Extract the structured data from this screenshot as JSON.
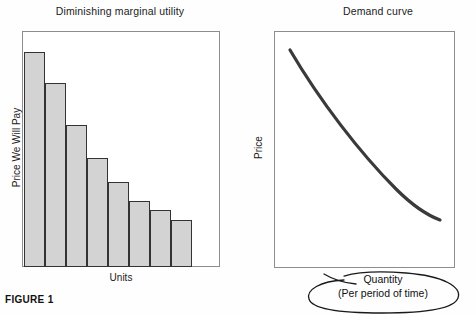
{
  "figure": {
    "caption": "FIGURE 1"
  },
  "panels": {
    "left": {
      "title": "Diminishing marginal utility",
      "xlabel": "Units",
      "ylabel": "Price We Will Pay"
    },
    "right": {
      "title": "Demand curve",
      "xlabel_line1": "Quantity",
      "xlabel_line2": "(Per period of time)",
      "ylabel": "Price"
    }
  },
  "colors": {
    "bar_fill": "#d3d3d3",
    "bar_stroke": "#333333",
    "box_stroke": "#8d8d8d",
    "curve_stroke": "#3a3a3a",
    "annotation_stroke": "#1a1a1a",
    "text": "#111111"
  },
  "chart_data": [
    {
      "type": "bar",
      "title": "Diminishing marginal utility",
      "xlabel": "Units",
      "ylabel": "Price We Will Pay",
      "categories": [
        "1",
        "2",
        "3",
        "4",
        "5",
        "6",
        "7",
        "8"
      ],
      "values": [
        91,
        78,
        60,
        46,
        36,
        28,
        24,
        20
      ],
      "ylim": [
        0,
        100
      ],
      "grid": false,
      "legend": "none",
      "axis_ticks": "none",
      "note": "Marginal utility declines with each additional unit consumed; bar heights are read as percentage of plot height."
    },
    {
      "type": "line",
      "title": "Demand curve",
      "xlabel": "Quantity (Per period of time)",
      "ylabel": "Price",
      "x": [
        0,
        10,
        20,
        30,
        40,
        50,
        60,
        70,
        80,
        90,
        100
      ],
      "y": [
        92,
        82,
        72,
        63,
        54,
        46,
        39,
        33,
        28,
        24,
        21
      ],
      "xlim": [
        0,
        100
      ],
      "ylim": [
        0,
        100
      ],
      "grid": false,
      "legend": "none",
      "axis_ticks": "none",
      "annotation": "Quantity (Per period of time) circled by hand-drawn oval",
      "note": "Downward-sloping convex demand curve; values are read as percentage of plot dimensions."
    }
  ]
}
